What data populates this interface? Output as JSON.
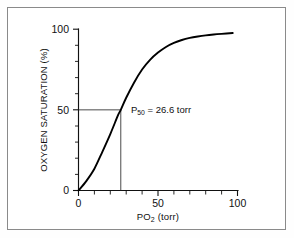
{
  "figure": {
    "background_color": "#ffffff",
    "frame_color": "#8a8a8a",
    "curve_color": "#000000",
    "axis_color": "#111111"
  },
  "chart_data": {
    "type": "line",
    "title": "",
    "xlabel_prefix": "PO",
    "xlabel_sub": "2",
    "xlabel_suffix": " (torr)",
    "xlabel_full": "PO2 (torr)",
    "ylabel": "OXYGEN SATURATION (%)",
    "xlim": [
      0,
      100
    ],
    "ylim": [
      0,
      100
    ],
    "xticks": [
      0,
      50,
      100
    ],
    "yticks": [
      0,
      50,
      100
    ],
    "xtick_labels": [
      "0",
      "50",
      "100"
    ],
    "ytick_labels": [
      "0",
      "50",
      "100"
    ],
    "x_minor_interval": 10,
    "y_minor_interval": 10,
    "grid": false,
    "legend": "none",
    "series": [
      {
        "name": "Oxygen-hemoglobin dissociation curve",
        "x": [
          0,
          5,
          10,
          15,
          20,
          25,
          26.6,
          30,
          35,
          40,
          45,
          50,
          55,
          60,
          65,
          70,
          75,
          80,
          85,
          90,
          97
        ],
        "values": [
          0,
          6,
          13.5,
          24,
          35,
          47,
          50,
          57.5,
          67,
          75,
          81,
          85.5,
          89,
          91.5,
          93.3,
          94.6,
          95.5,
          96.2,
          96.7,
          97.1,
          97.6
        ]
      }
    ],
    "annotations": [
      {
        "name": "p50-label",
        "text_prefix": "P",
        "text_sub": "50",
        "text_suffix": " = 26.6 torr",
        "text_full": "P50 = 26.6 torr",
        "x": 33,
        "y": 50
      }
    ],
    "guide_lines": [
      {
        "name": "saturation-50-horizontal",
        "orientation": "horizontal",
        "value": 50,
        "from": 0,
        "to": 26.6
      },
      {
        "name": "p50-vertical",
        "orientation": "vertical",
        "value": 26.6,
        "from": 0,
        "to": 50
      }
    ]
  }
}
